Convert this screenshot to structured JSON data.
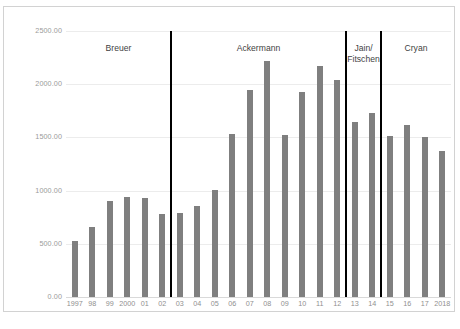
{
  "chart_data": {
    "type": "bar",
    "title": "",
    "xlabel": "",
    "ylabel": "",
    "ylim": [
      0,
      2500
    ],
    "ytick_step": 500,
    "grid": true,
    "legend": null,
    "bar_color": "#7f7f7f",
    "divider_color": "#000000",
    "categories": [
      "1997",
      "98",
      "99",
      "2000",
      "01",
      "02",
      "03",
      "04",
      "05",
      "06",
      "07",
      "08",
      "09",
      "10",
      "11",
      "12",
      "13",
      "14",
      "15",
      "16",
      "17",
      "2018"
    ],
    "values": [
      530,
      660,
      900,
      940,
      935,
      780,
      790,
      855,
      1005,
      1535,
      1945,
      2220,
      1520,
      1925,
      2175,
      2035,
      1645,
      1730,
      1510,
      1620,
      1500,
      1375
    ],
    "ytick_labels": [
      "0.00",
      "500.00",
      "1000.00",
      "1500.00",
      "2000.00",
      "2500.00"
    ],
    "ytick_values": [
      0,
      500,
      1000,
      1500,
      2000,
      2500
    ],
    "eras": [
      {
        "name": "Breuer",
        "start_index": 0,
        "end_index": 5
      },
      {
        "name": "Ackermann",
        "start_index": 6,
        "end_index": 15
      },
      {
        "name": "Jain/\nFitschen",
        "start_index": 16,
        "end_index": 17
      },
      {
        "name": "Cryan",
        "start_index": 18,
        "end_index": 21
      }
    ],
    "divider_after_index": [
      5,
      15,
      17
    ]
  },
  "caption": {
    "text": ""
  }
}
